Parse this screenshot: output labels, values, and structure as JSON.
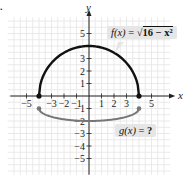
{
  "figure": {
    "corner_mark": ".",
    "x_axis_label": "x",
    "y_axis_label": "y",
    "x_tick_labels": [
      "-5",
      "-3",
      "-2",
      "-1",
      "1",
      "2",
      "3",
      "5"
    ],
    "y_tick_labels": [
      "5",
      "3",
      "2",
      "1",
      "-1",
      "-2",
      "-3",
      "-4",
      "-5"
    ],
    "f_label": {
      "name": "f(x)",
      "eq": "=",
      "expr_radicand": "16 − x²",
      "full": "f(x) = √(16 − x²)"
    },
    "g_label": {
      "name": "g(x)",
      "eq": "=",
      "value": "?",
      "full": "g(x) = ?"
    },
    "colors": {
      "f_curve": "#111111",
      "g_curve": "#777777",
      "grid": "#e4e4e4",
      "axis": "#222222",
      "label_bg": "#e6e6e6"
    }
  },
  "chart_data": {
    "type": "line",
    "title": "",
    "xlabel": "x",
    "ylabel": "y",
    "xlim": [
      -6,
      6
    ],
    "ylim": [
      -6,
      6
    ],
    "grid": true,
    "series": [
      {
        "name": "f(x) = √(16 − x²)",
        "x": [
          -4,
          -3,
          -2,
          -1,
          0,
          1,
          2,
          3,
          4
        ],
        "y": [
          0,
          2.65,
          3.46,
          3.87,
          4,
          3.87,
          3.46,
          2.65,
          0
        ],
        "endpoints": [
          [
            -4,
            0
          ],
          [
            4,
            0
          ]
        ]
      },
      {
        "name": "g(x) = ?",
        "x": [
          -4,
          -3,
          -2,
          -1,
          0,
          1,
          2,
          3,
          4
        ],
        "y": [
          -1,
          -1.5,
          -1.8,
          -1.95,
          -2,
          -1.95,
          -1.8,
          -1.5,
          -1
        ],
        "endpoints": [
          [
            -4,
            -1
          ],
          [
            4,
            -1
          ]
        ]
      }
    ]
  }
}
